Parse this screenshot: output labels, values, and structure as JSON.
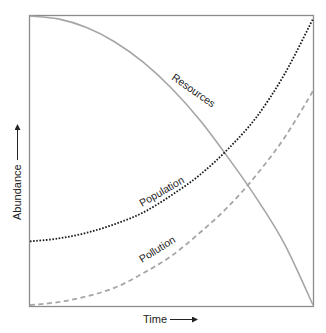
{
  "chart_data": {
    "type": "line",
    "title": "",
    "xlabel": "Time",
    "ylabel": "Abundance",
    "x_axis_arrow": true,
    "y_axis_arrow": true,
    "grid": false,
    "legend": "inline curve labels",
    "x": [
      0,
      0.1,
      0.2,
      0.3,
      0.4,
      0.5,
      0.6,
      0.7,
      0.8,
      0.9,
      1.0
    ],
    "ylim": [
      0,
      1
    ],
    "xlim": [
      0,
      1
    ],
    "series": [
      {
        "name": "Resources",
        "style": "solid",
        "color": "#a6a6a6",
        "values": [
          1.0,
          0.99,
          0.96,
          0.91,
          0.84,
          0.75,
          0.64,
          0.51,
          0.37,
          0.21,
          0.0
        ]
      },
      {
        "name": "Population",
        "style": "dotted",
        "color": "#1a1a1a",
        "values": [
          0.22,
          0.23,
          0.25,
          0.28,
          0.32,
          0.38,
          0.45,
          0.54,
          0.65,
          0.8,
          0.99
        ]
      },
      {
        "name": "Pollution",
        "style": "dashed",
        "color": "#a6a6a6",
        "values": [
          0.0,
          0.01,
          0.03,
          0.06,
          0.11,
          0.17,
          0.25,
          0.34,
          0.45,
          0.58,
          0.74
        ]
      }
    ]
  },
  "labels": {
    "resources": "Resources",
    "population": "Population",
    "pollution": "Pollution",
    "x_axis": "Time",
    "y_axis": "Abundance"
  },
  "colors": {
    "frame": "#8c8c8c",
    "resources": "#a6a6a6",
    "population": "#1a1a1a",
    "pollution": "#a6a6a6",
    "text": "#222222"
  }
}
